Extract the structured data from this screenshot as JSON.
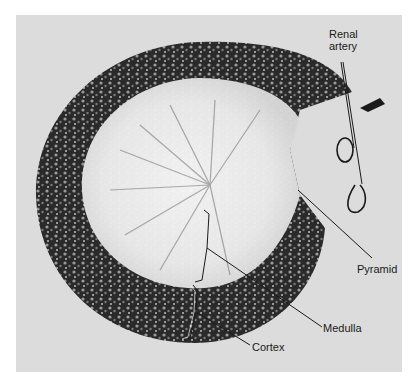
{
  "figure": {
    "background_color": "#dcdcdc",
    "tissue_dark_color": "#1e1e1e",
    "tissue_light_color": "#f2f2f2"
  },
  "labels": {
    "renal_artery_line1": "Renal",
    "renal_artery_line2": "artery",
    "pyramid": "Pyramid",
    "medulla": "Medulla",
    "cortex": "Cortex"
  }
}
